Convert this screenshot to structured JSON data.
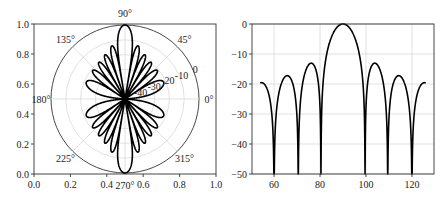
{
  "chart_data": [
    {
      "type": "polar-line",
      "title": "",
      "description": "Array factor radiation pattern (dB) of a 12-element uniform linear array, half-wavelength spacing, plotted in polar coordinates",
      "model": {
        "elements": 12,
        "spacing_wavelengths": 0.5,
        "floor_db": -50
      },
      "r_range": [
        -50,
        0
      ],
      "r_ticks": [
        -40,
        -30,
        -20,
        -10,
        0
      ],
      "r_tick_labels": [
        "-40",
        "-30",
        "-20",
        "-10",
        "0"
      ],
      "r_label_angle_deg": 22.5,
      "theta_ticks_deg": [
        0,
        45,
        90,
        135,
        180,
        225,
        270,
        315
      ],
      "theta_tick_labels": [
        "0°",
        "45°",
        "90°",
        "135°",
        "180°",
        "225°",
        "270°",
        "315°"
      ],
      "cartesian_frame": {
        "xlim": [
          0.0,
          1.0
        ],
        "ylim": [
          0.0,
          1.0
        ],
        "x_ticks": [
          "0.0",
          "0.2",
          "0.4",
          "0.6",
          "0.8",
          "1.0"
        ],
        "y_ticks": [
          "0.0",
          "0.2",
          "0.4",
          "0.6",
          "0.8",
          "1.0"
        ]
      },
      "lobes": {
        "main_lobe_deg": [
          90,
          270
        ],
        "sidelobes_per_side": 5
      },
      "grid": true
    },
    {
      "type": "line",
      "title": "",
      "xlabel": "",
      "ylabel": "",
      "description": "Same array factor in dB versus angle (degrees), 54° to 126°",
      "model": {
        "elements": 12,
        "spacing_wavelengths": 0.5,
        "floor_db": -50
      },
      "x_range_data": [
        54,
        126
      ],
      "xlim": [
        50.4,
        129.6
      ],
      "ylim": [
        -50,
        0
      ],
      "x_ticks": [
        60,
        80,
        100,
        120
      ],
      "y_ticks": [
        0,
        -10,
        -20,
        -30,
        -40,
        -50
      ],
      "x": [
        54,
        60,
        65.7,
        70.5,
        76.2,
        80.4,
        90,
        99.6,
        103.8,
        109.5,
        114.3,
        120,
        126
      ],
      "values": [
        -19.6,
        -50,
        -17.8,
        -50,
        -13.3,
        -50,
        0,
        -50,
        -13.3,
        -50,
        -17.8,
        -50,
        -19.6
      ],
      "series": [
        {
          "name": "AF (dB)",
          "color": "#000000"
        }
      ],
      "grid": true
    }
  ],
  "layout": {
    "left_axes": {
      "x0": 34,
      "y0": 24,
      "x1": 216,
      "y1": 174
    },
    "polar": {
      "cx": 125,
      "cy": 99,
      "r": 74
    },
    "right_axes": {
      "x0": 252,
      "y0": 24,
      "x1": 434,
      "y1": 174
    }
  }
}
